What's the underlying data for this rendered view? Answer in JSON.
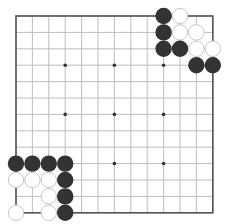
{
  "board": {
    "size": 13,
    "origin": {
      "x": 16,
      "y": 16
    },
    "spacing": 16.4,
    "stone_radius": 8.2,
    "colors": {
      "background": "#ffffff",
      "grid_line": "#bdbdbd",
      "border": "#555555",
      "star_point": "#333333",
      "black_stone": "#333333",
      "white_stone_fill": "#ffffff",
      "white_stone_stroke": "#c8c8c8"
    },
    "star_points": [
      [
        3,
        3
      ],
      [
        3,
        6
      ],
      [
        3,
        9
      ],
      [
        6,
        3
      ],
      [
        6,
        6
      ],
      [
        6,
        9
      ],
      [
        9,
        3
      ],
      [
        9,
        6
      ],
      [
        9,
        9
      ]
    ],
    "stones": [
      {
        "row": 0,
        "col": 9,
        "color": "black"
      },
      {
        "row": 0,
        "col": 10,
        "color": "white"
      },
      {
        "row": 1,
        "col": 9,
        "color": "black"
      },
      {
        "row": 1,
        "col": 10,
        "color": "white"
      },
      {
        "row": 1,
        "col": 11,
        "color": "white"
      },
      {
        "row": 2,
        "col": 9,
        "color": "black"
      },
      {
        "row": 2,
        "col": 10,
        "color": "black"
      },
      {
        "row": 2,
        "col": 11,
        "color": "white"
      },
      {
        "row": 2,
        "col": 12,
        "color": "white"
      },
      {
        "row": 3,
        "col": 11,
        "color": "black"
      },
      {
        "row": 3,
        "col": 12,
        "color": "black"
      },
      {
        "row": 9,
        "col": 0,
        "color": "black"
      },
      {
        "row": 9,
        "col": 1,
        "color": "black"
      },
      {
        "row": 9,
        "col": 2,
        "color": "black"
      },
      {
        "row": 9,
        "col": 3,
        "color": "black"
      },
      {
        "row": 10,
        "col": 0,
        "color": "white"
      },
      {
        "row": 10,
        "col": 1,
        "color": "white"
      },
      {
        "row": 10,
        "col": 2,
        "color": "white"
      },
      {
        "row": 10,
        "col": 3,
        "color": "black"
      },
      {
        "row": 11,
        "col": 2,
        "color": "white"
      },
      {
        "row": 11,
        "col": 3,
        "color": "black"
      },
      {
        "row": 12,
        "col": 0,
        "color": "white"
      },
      {
        "row": 12,
        "col": 2,
        "color": "white"
      },
      {
        "row": 12,
        "col": 3,
        "color": "black"
      }
    ]
  }
}
